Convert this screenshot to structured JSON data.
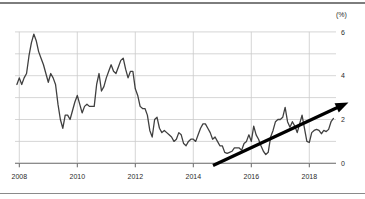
{
  "chart_data": {
    "type": "line",
    "title": "",
    "unit_label": "(%)",
    "x_axis": {
      "tick_labels": [
        "2008",
        "2010",
        "2012",
        "2014",
        "2016",
        "2018"
      ],
      "tick_years": [
        2008,
        2010,
        2012,
        2014,
        2016,
        2018
      ]
    },
    "y_axis": {
      "tick_labels": [
        "0",
        "2",
        "4",
        "6"
      ],
      "tick_values": [
        0,
        2,
        4,
        6
      ],
      "gridline_values": [
        0,
        1,
        2,
        3,
        4,
        5,
        6
      ],
      "range": [
        0,
        6
      ]
    },
    "grid": true,
    "legend": "none",
    "series": [
      {
        "name": "monthly-rate-percent",
        "color": "#404040",
        "frequency": "monthly",
        "x_start_year": 2007,
        "x_start_month": 12,
        "values": [
          3.6,
          3.9,
          3.6,
          3.9,
          4.1,
          4.9,
          5.5,
          5.9,
          5.6,
          5.1,
          4.8,
          4.5,
          4.1,
          3.7,
          4.1,
          3.9,
          3.6,
          2.7,
          2.0,
          1.6,
          2.2,
          2.2,
          2.0,
          2.4,
          2.8,
          3.1,
          2.7,
          2.3,
          2.6,
          2.7,
          2.6,
          2.6,
          2.6,
          3.6,
          4.1,
          3.3,
          3.5,
          3.9,
          4.2,
          4.5,
          4.2,
          4.1,
          4.4,
          4.7,
          4.8,
          4.3,
          3.9,
          4.2,
          4.2,
          3.4,
          3.1,
          2.6,
          2.5,
          2.5,
          2.2,
          1.5,
          1.2,
          2.0,
          2.1,
          1.6,
          1.4,
          1.5,
          1.4,
          1.3,
          1.2,
          1.0,
          1.1,
          1.4,
          1.3,
          0.9,
          0.8,
          1.0,
          1.1,
          1.1,
          1.0,
          1.3,
          1.6,
          1.8,
          1.8,
          1.6,
          1.4,
          1.1,
          1.2,
          1.0,
          0.8,
          0.8,
          0.5,
          0.45,
          0.5,
          0.55,
          0.7,
          0.7,
          0.7,
          0.6,
          0.9,
          1.0,
          1.3,
          1.0,
          1.7,
          1.3,
          1.1,
          0.8,
          0.55,
          0.4,
          0.5,
          1.2,
          1.5,
          1.9,
          2.0,
          2.0,
          2.1,
          2.55,
          1.9,
          1.65,
          1.9,
          1.7,
          1.4,
          1.8,
          2.2,
          1.6,
          1.0,
          0.95,
          1.4,
          1.5,
          1.55,
          1.5,
          1.35,
          1.5,
          1.45,
          1.55,
          1.9,
          2.05
        ]
      }
    ],
    "annotation_arrow": {
      "x_from": 2014.68,
      "y_from": -0.1,
      "x_to": 2019.35,
      "y_to": 2.78,
      "color": "#000000"
    },
    "colors": {
      "grid": "#cccccc",
      "axis": "#666666",
      "labels": "#2b2b2b",
      "rules": "#7d7d7d"
    }
  }
}
